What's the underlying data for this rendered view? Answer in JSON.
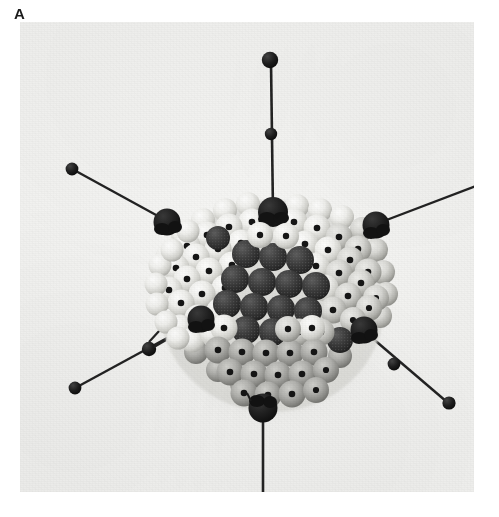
{
  "figure": {
    "panel_label": "A",
    "caption_visible": false
  },
  "photo": {
    "background_color": "#f2f2f0",
    "plate_left": 20,
    "plate_top": 22,
    "plate_width": 454,
    "plate_height": 470,
    "media": "black-and-white photograph"
  },
  "palette": {
    "background": "#f2f2f0",
    "capsomer_light": "#efefec",
    "capsomer_light_shadow": "#b6b6b2",
    "capsomer_shaded": "#9a9a96",
    "capsomer_dark": "#2e2e2e",
    "capsomer_dark_texture": "#4a4a4a",
    "pinhole": "#141414",
    "vertex_sphere": "#1a1a1a",
    "fiber_rod": "#202020",
    "fiber_knob": "#161616",
    "label_text": "#1b1b1b"
  },
  "model": {
    "center": {
      "x": 252,
      "y": 284
    },
    "radius": 115,
    "capsid_description": "quasi-spherical shell of close-packed spheres",
    "facets": [
      {
        "name": "top-facet",
        "shading": "light",
        "capsomer_count": 21
      },
      {
        "name": "left-facet",
        "shading": "light",
        "capsomer_count": 21
      },
      {
        "name": "right-facet",
        "shading": "mid",
        "capsomer_count": 21
      },
      {
        "name": "front-facet",
        "shading": "dark",
        "capsomer_count": 19
      },
      {
        "name": "bottom-facet",
        "shading": "shadow",
        "capsomer_count": 21
      }
    ],
    "vertices": [
      {
        "name": "vertex-top",
        "x": 253,
        "y": 190,
        "radius": 15
      },
      {
        "name": "vertex-upper-left",
        "x": 147,
        "y": 200,
        "radius": 14
      },
      {
        "name": "vertex-upper-right",
        "x": 356,
        "y": 203,
        "radius": 14
      },
      {
        "name": "vertex-lower-left",
        "x": 181,
        "y": 297,
        "radius": 14
      },
      {
        "name": "vertex-lower-right",
        "x": 344,
        "y": 308,
        "radius": 14
      },
      {
        "name": "vertex-bottom",
        "x": 243,
        "y": 386,
        "radius": 15
      }
    ],
    "fibers": [
      {
        "name": "fiber-top",
        "base_x": 253,
        "base_y": 188,
        "tip_x": 250,
        "tip_y": 38,
        "knob_radius": 8,
        "mid_bead": {
          "x": 251,
          "y": 112,
          "radius": 6
        }
      },
      {
        "name": "fiber-upper-left",
        "base_x": 145,
        "base_y": 198,
        "tip_x": 52,
        "tip_y": 147,
        "knob_radius": 6,
        "mid_bead": null
      },
      {
        "name": "fiber-upper-right",
        "base_x": 357,
        "base_y": 201,
        "tip_x": 466,
        "tip_y": 160,
        "knob_radius": 7,
        "mid_bead": null
      },
      {
        "name": "fiber-lower-left",
        "base_x": 180,
        "base_y": 299,
        "tip_x": 55,
        "tip_y": 366,
        "knob_radius": 6,
        "mid_bead": {
          "x": 129,
          "y": 327,
          "radius": 7
        }
      },
      {
        "name": "fiber-lower-right",
        "base_x": 346,
        "base_y": 310,
        "tip_x": 429,
        "tip_y": 381,
        "knob_radius": 6,
        "mid_bead": {
          "x": 374,
          "y": 342,
          "radius": 6
        }
      },
      {
        "name": "fiber-bottom",
        "base_x": 243,
        "base_y": 388,
        "tip_x": 243,
        "tip_y": 482,
        "knob_radius": 8,
        "mid_bead": null
      }
    ],
    "counts": {
      "visible_fibers": 6,
      "visible_vertices": 6,
      "dark_center_capsomers": 18
    }
  }
}
